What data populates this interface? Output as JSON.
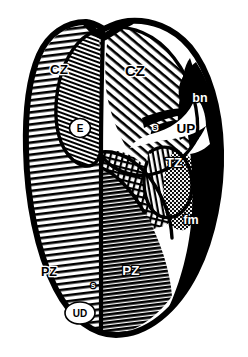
{
  "figure": {
    "background_color": "#ffffff",
    "ink_color": "#000000",
    "width": 248,
    "height": 357
  },
  "labels": {
    "central_zone_left": "CZ",
    "central_zone_right": "CZ",
    "peripheral_zone_left": "PZ",
    "peripheral_zone_right": "PZ",
    "transition_zone": "TZ",
    "urethra_proximal": "UP",
    "urethra_distal": "UD",
    "ejaculatory_duct": "E",
    "bladder_neck": "bn",
    "fibromuscular_stroma": "fm",
    "septum_upper": "s",
    "septum_lower": "s"
  },
  "regions": [
    {
      "name": "central-zone-left",
      "label": "CZ",
      "fill_style": "fine-diagonal-hatch",
      "tone": "light"
    },
    {
      "name": "central-zone-right",
      "label": "CZ",
      "fill_style": "coarse-diagonal-hatch",
      "tone": "light"
    },
    {
      "name": "peripheral-zone-left",
      "label": "PZ",
      "fill_style": "horizontal-hatch",
      "tone": "light"
    },
    {
      "name": "peripheral-zone-right",
      "label": "PZ",
      "fill_style": "dense-horizontal-hatch",
      "tone": "dark"
    },
    {
      "name": "transition-zone",
      "label": "TZ",
      "fill_style": "vertical-hatch",
      "tone": "light"
    },
    {
      "name": "transition-zone-stipple",
      "label": "TZ",
      "fill_style": "stipple",
      "tone": "mid"
    },
    {
      "name": "periurethral-crosshatch",
      "label": "",
      "fill_style": "crosshatch",
      "tone": "mid"
    },
    {
      "name": "fibromuscular-band",
      "label": "fm",
      "fill_style": "solid-black",
      "tone": "black"
    },
    {
      "name": "bladder-neck-band",
      "label": "bn",
      "fill_style": "solid-black",
      "tone": "black"
    },
    {
      "name": "urethra-lumen",
      "label": "UP",
      "fill_style": "solid-white",
      "tone": "white"
    }
  ],
  "colors": {
    "ink": "#000000",
    "paper": "#ffffff",
    "mid_tone": "#6f6f6f"
  }
}
